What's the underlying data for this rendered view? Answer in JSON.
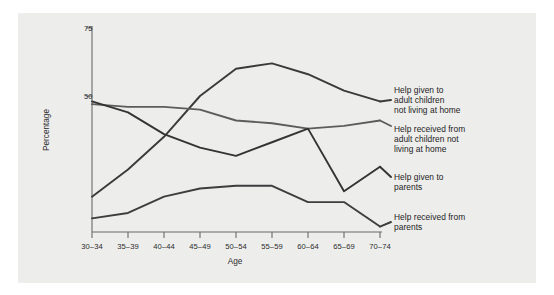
{
  "chart_data": {
    "type": "line",
    "title": "",
    "subtitle": "",
    "xlabel": "Age",
    "ylabel": "Percentage",
    "categories": [
      "30–34",
      "35–39",
      "40–44",
      "45–49",
      "50–54",
      "55–59",
      "60–64",
      "65–69",
      "70–74"
    ],
    "ytick_labels": [
      "50",
      "75"
    ],
    "yticks": [
      50,
      75
    ],
    "ylim": [
      0,
      75
    ],
    "grid": false,
    "legend_position": "right-inline-labels",
    "series": [
      {
        "name": "Help given to adult children not living at home",
        "values": [
          13,
          23,
          35,
          50,
          60,
          62,
          58,
          52,
          48
        ],
        "color": "#3a3a3a"
      },
      {
        "name": "Help received from adult children not living at home",
        "values": [
          47,
          46,
          46,
          45,
          41,
          40,
          38,
          39,
          41
        ],
        "color": "#5c5c5c"
      },
      {
        "name": "Help given to parents",
        "values": [
          48,
          44,
          36,
          31,
          28,
          33,
          38,
          15,
          24
        ],
        "color": "#333333"
      },
      {
        "name": "Help received from parents",
        "values": [
          5,
          7,
          13,
          16,
          17,
          17,
          11,
          11,
          2
        ],
        "color": "#3d3d3d"
      }
    ]
  },
  "axis": {
    "ylabel": "Percentage",
    "xlabel": "Age"
  },
  "labels": {
    "series_1_lines": [
      "Help given to",
      "adult children",
      "not living at home"
    ],
    "series_2_lines": [
      "Help received from",
      "adult children not",
      "living at home"
    ],
    "series_3_lines": [
      "Help given to",
      "parents"
    ],
    "series_4_lines": [
      "Help received from",
      "parents"
    ]
  },
  "colors": {
    "panel_background": "#ededec",
    "page_background": "#ffffff",
    "axis_line": "#6a6a6a",
    "text": "#2b2b2b",
    "line_dark": "#3a3a3a",
    "line_mid": "#5c5c5c"
  }
}
